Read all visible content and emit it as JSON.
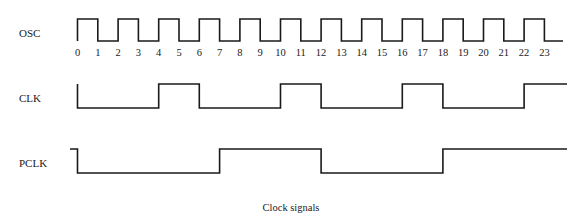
{
  "caption": "Clock signals",
  "layout": {
    "x0": 77.5,
    "tick_px": 20.3,
    "end_x": 566
  },
  "signals": [
    {
      "name": "OSC",
      "label_y": 33,
      "high_y": 19,
      "low_y": 41,
      "initial": "high",
      "start_from_low": true,
      "transitions": [
        1,
        2,
        3,
        4,
        5,
        6,
        7,
        8,
        9,
        10,
        11,
        12,
        13,
        14,
        15,
        16,
        17,
        18,
        19,
        20,
        21,
        22,
        23
      ],
      "end_x": 563
    },
    {
      "name": "CLK",
      "label_y": 98,
      "high_y": 84,
      "low_y": 108,
      "initial": "low",
      "start_from_low": false,
      "start_stub_y": 84,
      "transitions": [
        4,
        6,
        10,
        12,
        16,
        18,
        22
      ],
      "end_x": 567
    },
    {
      "name": "PCLK",
      "label_y": 163,
      "high_y": 149,
      "low_y": 173,
      "initial": "low",
      "start_from_low": false,
      "start_stub": {
        "x_from": 70,
        "y": 149
      },
      "transitions": [
        7,
        12,
        18
      ],
      "end_x": 567
    }
  ],
  "ticks": {
    "y": 52,
    "labels": [
      "0",
      "1",
      "2",
      "3",
      "4",
      "5",
      "6",
      "7",
      "8",
      "9",
      "10",
      "11",
      "12",
      "13",
      "14",
      "15",
      "16",
      "17",
      "18",
      "19",
      "20",
      "21",
      "22",
      "23"
    ]
  },
  "chart_data": {
    "type": "timing",
    "title": "Clock signals",
    "x_ticks": [
      0,
      1,
      2,
      3,
      4,
      5,
      6,
      7,
      8,
      9,
      10,
      11,
      12,
      13,
      14,
      15,
      16,
      17,
      18,
      19,
      20,
      21,
      22,
      23
    ],
    "series": [
      {
        "name": "OSC",
        "values": [
          1,
          0,
          1,
          0,
          1,
          0,
          1,
          0,
          1,
          0,
          1,
          0,
          1,
          0,
          1,
          0,
          1,
          0,
          1,
          0,
          1,
          0,
          1,
          0
        ]
      },
      {
        "name": "CLK",
        "values": [
          0,
          0,
          0,
          0,
          1,
          1,
          0,
          0,
          0,
          0,
          1,
          1,
          0,
          0,
          0,
          0,
          1,
          1,
          0,
          0,
          0,
          0,
          1,
          1
        ]
      },
      {
        "name": "PCLK",
        "values": [
          0,
          0,
          0,
          0,
          0,
          0,
          0,
          1,
          1,
          1,
          1,
          1,
          0,
          0,
          0,
          0,
          0,
          0,
          1,
          1,
          1,
          1,
          1,
          1
        ]
      }
    ]
  }
}
